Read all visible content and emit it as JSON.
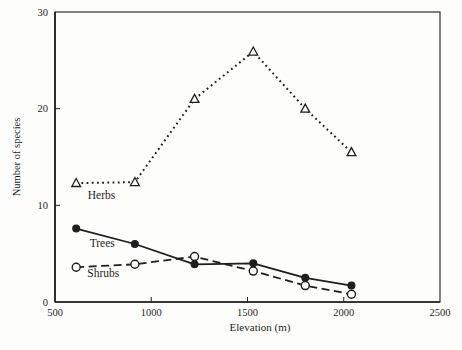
{
  "figure": {
    "background": "#fdfdfc",
    "ink": "#1e1e1e"
  },
  "chart_data": {
    "type": "line",
    "title": "",
    "xlabel": "Elevation (m)",
    "ylabel": "Number of species",
    "xlim": [
      500,
      2500
    ],
    "ylim": [
      0,
      30
    ],
    "x_ticks": [
      "500",
      "1000",
      "1500",
      "2000",
      "2500"
    ],
    "x_tick_values": [
      500,
      1000,
      1500,
      2000,
      2500
    ],
    "y_ticks": [
      "0",
      "10",
      "20",
      "30"
    ],
    "y_tick_values": [
      0,
      10,
      20,
      30
    ],
    "grid": false,
    "legend_position": "inline-labels",
    "x": [
      610,
      915,
      1225,
      1530,
      1800,
      2040
    ],
    "series": [
      {
        "name": "Herbs",
        "values": [
          12.3,
          12.4,
          21.0,
          25.9,
          20.0,
          15.5
        ],
        "line": "dotted",
        "marker": "open-triangle",
        "label_x": 670,
        "label_y": 10.7
      },
      {
        "name": "Trees",
        "values": [
          7.6,
          6.0,
          3.9,
          4.0,
          2.5,
          1.7
        ],
        "line": "solid",
        "marker": "filled-circle",
        "label_x": 680,
        "label_y": 5.7
      },
      {
        "name": "Shrubs",
        "values": [
          3.6,
          3.9,
          4.7,
          3.2,
          1.7,
          0.8
        ],
        "line": "dashed",
        "marker": "open-circle",
        "label_x": 668,
        "label_y": 2.6
      }
    ]
  }
}
